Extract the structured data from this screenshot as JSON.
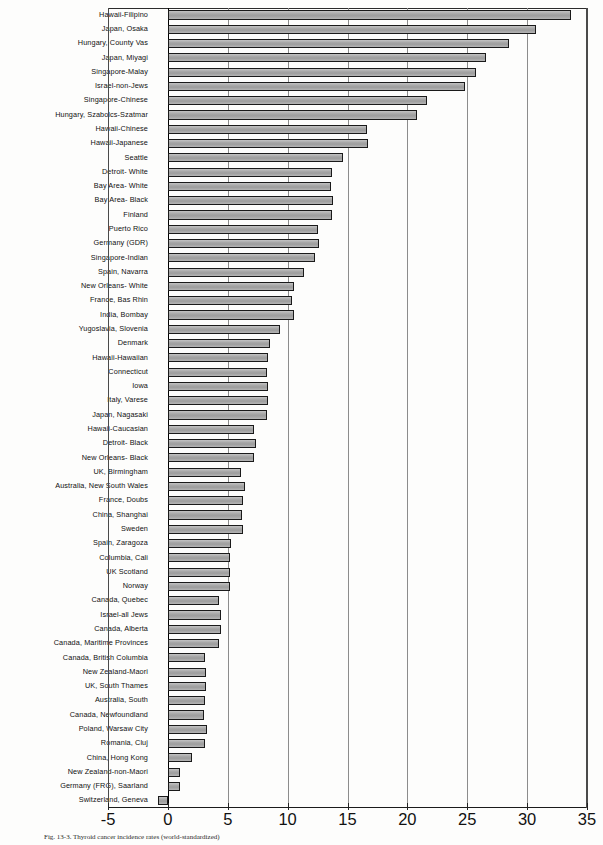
{
  "chart_data": {
    "type": "bar",
    "orientation": "horizontal",
    "title": "",
    "xlabel": "",
    "ylabel": "",
    "xlim": [
      -5,
      35
    ],
    "xticks": [
      -5,
      0,
      5,
      10,
      15,
      20,
      25,
      30,
      35
    ],
    "grid": true,
    "legend": null,
    "categories": [
      "Hawaii-Filipino",
      "Japan, Osaka",
      "Hungary, County Vas",
      "Japan, Miyagi",
      "Singapore-Malay",
      "Israel-non-Jews",
      "Singapore-Chinese",
      "Hungary, Szabolcs-Szatmar",
      "Hawaii-Chinese",
      "Hawaii-Japanese",
      "Seattle",
      "Detroit- White",
      "Bay Area- White",
      "Bay Area- Black",
      "Finland",
      "Puerto Rico",
      "Germany (GDR)",
      "Singapore-Indian",
      "Spain, Navarra",
      "New Orleans- White",
      "France, Bas Rhin",
      "India, Bombay",
      "Yugoslavia, Slovenia",
      "Denmark",
      "Hawaii-Hawaiian",
      "Connecticut",
      "Iowa",
      "Italy, Varese",
      "Japan, Nagasaki",
      "Hawaii-Caucasian",
      "Detroit- Black",
      "New Orleans- Black",
      "UK, Birmingham",
      "Australia, New South Wales",
      "France, Doubs",
      "China, Shanghai",
      "Sweden",
      "Spain, Zaragoza",
      "Columbia, Cali",
      "UK Scotland",
      "Norway",
      "Canada, Quebec",
      "Israel-all Jews",
      "Canada, Alberta",
      "Canada, Maritime Provinces",
      "Canada, British Columbia",
      "New Zealand-Maori",
      "UK, South Thames",
      "Australia, South",
      "Canada, Newfoundland",
      "Poland, Warsaw City",
      "Romania, Cluj",
      "China, Hong Kong",
      "New Zealand-non-Maori",
      "Germany (FRG), Saarland",
      "Switzerland, Geneva"
    ],
    "values": [
      33.7,
      30.7,
      28.5,
      26.6,
      25.7,
      24.8,
      21.6,
      20.8,
      16.6,
      16.7,
      14.6,
      13.7,
      13.6,
      13.8,
      13.7,
      12.5,
      12.6,
      12.3,
      11.4,
      10.5,
      10.4,
      10.5,
      9.4,
      8.5,
      8.4,
      8.3,
      8.4,
      8.4,
      8.3,
      7.2,
      7.4,
      7.2,
      6.1,
      6.4,
      6.3,
      6.2,
      6.3,
      5.3,
      5.2,
      5.2,
      5.2,
      4.3,
      4.4,
      4.4,
      4.3,
      3.1,
      3.2,
      3.2,
      3.1,
      3.0,
      3.3,
      3.1,
      2.0,
      1.0,
      1.0,
      -0.8
    ]
  },
  "axis": {
    "tick_labels": [
      "-5",
      "0",
      "5",
      "10",
      "15",
      "20",
      "25",
      "30",
      "35"
    ]
  },
  "caption": "Fig. 13-3. Thyroid cancer incidence rates (world-standardized)"
}
